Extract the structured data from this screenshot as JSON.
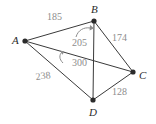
{
  "figure": {
    "type": "geometry-diagram",
    "background_color": "#ffffff",
    "line_color": "#3a3a3a",
    "vertex_color": "#2b2b2b",
    "label_color": "#2b2b2b",
    "measure_color": "#8d8d8d",
    "vertices": [
      {
        "id": "A",
        "label": "A",
        "x": 25,
        "y": 41,
        "label_x": 12,
        "label_y": 35
      },
      {
        "id": "B",
        "label": "B",
        "x": 94,
        "y": 21,
        "label_x": 91,
        "label_y": 4
      },
      {
        "id": "C",
        "label": "C",
        "x": 133,
        "y": 72,
        "label_x": 139,
        "label_y": 70
      },
      {
        "id": "D",
        "label": "D",
        "x": 93,
        "y": 100,
        "label_x": 89,
        "label_y": 107
      }
    ],
    "edges": [
      {
        "id": "AB",
        "from": "A",
        "to": "B",
        "measure": "185",
        "kind": "side"
      },
      {
        "id": "BC",
        "from": "B",
        "to": "C",
        "measure": "174",
        "kind": "side"
      },
      {
        "id": "CD",
        "from": "C",
        "to": "D",
        "measure": "128",
        "kind": "side"
      },
      {
        "id": "AD",
        "from": "A",
        "to": "D",
        "measure": "238",
        "kind": "side"
      },
      {
        "id": "BD",
        "from": "B",
        "to": "D",
        "measure": "205",
        "kind": "diagonal"
      },
      {
        "id": "AC",
        "from": "A",
        "to": "C",
        "measure": "300",
        "kind": "diagonal"
      }
    ],
    "measure_labels": [
      {
        "id": "AB",
        "text": "185",
        "x": 47,
        "y": 12
      },
      {
        "id": "BD",
        "text": "205",
        "x": 72,
        "y": 38
      },
      {
        "id": "BC",
        "text": "174",
        "x": 112,
        "y": 33
      },
      {
        "id": "AC",
        "text": "300",
        "x": 72,
        "y": 58
      },
      {
        "id": "AD",
        "text": "238",
        "x": 35,
        "y": 72
      },
      {
        "id": "CD",
        "text": "128",
        "x": 112,
        "y": 87
      }
    ],
    "leader_arrows": [
      {
        "id": "arrow-to-bd",
        "target_edge": "BD",
        "for_label": "205"
      },
      {
        "id": "arrow-to-ac",
        "target_edge": "AC",
        "for_label": "300"
      }
    ]
  }
}
